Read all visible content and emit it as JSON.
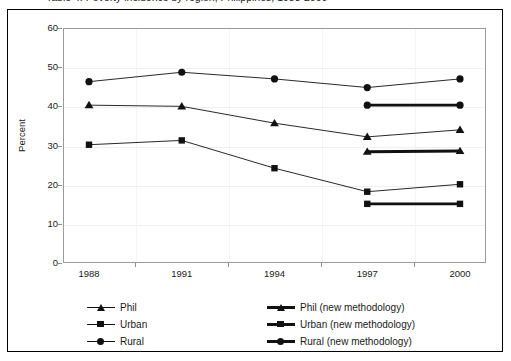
{
  "figure": {
    "title_clipped": "Table 4. Poverty incidence by region, Philippines, 1988-2000",
    "frame_color": "#000000",
    "plot_border_color": "#9a9a9a"
  },
  "chart_data": {
    "type": "line",
    "title": "",
    "xlabel": "",
    "ylabel": "Percent",
    "x": [
      1988,
      1991,
      1994,
      1997,
      2000
    ],
    "categories": [
      "1988",
      "1991",
      "1994",
      "1997",
      "2000"
    ],
    "ylim": [
      0,
      60
    ],
    "ytick_labels": [
      "0",
      "10",
      "20",
      "30",
      "40",
      "50",
      "60"
    ],
    "ytick_values": [
      0,
      10,
      20,
      30,
      40,
      50,
      60
    ],
    "grid": true,
    "legend_position": "bottom",
    "series": [
      {
        "name": "Phil",
        "marker": "triangle",
        "line": "thin",
        "color": "#111111",
        "x": [
          1988,
          1991,
          1994,
          1997,
          2000
        ],
        "values": [
          40.3,
          40.0,
          35.7,
          32.2,
          34.0
        ]
      },
      {
        "name": "Urban",
        "marker": "square",
        "line": "thin",
        "color": "#111111",
        "x": [
          1988,
          1991,
          1994,
          1997,
          2000
        ],
        "values": [
          30.2,
          31.3,
          24.2,
          18.2,
          20.1
        ]
      },
      {
        "name": "Rural",
        "marker": "circle",
        "line": "thin",
        "color": "#111111",
        "x": [
          1988,
          1991,
          1994,
          1997,
          2000
        ],
        "values": [
          46.3,
          48.7,
          47.0,
          44.8,
          47.0
        ]
      },
      {
        "name": "Phil (new methodology)",
        "marker": "triangle",
        "line": "thick",
        "color": "#111111",
        "x": [
          1997,
          2000
        ],
        "values": [
          28.4,
          28.6
        ]
      },
      {
        "name": "Urban (new methodology)",
        "marker": "square",
        "line": "thick",
        "color": "#111111",
        "x": [
          1997,
          2000
        ],
        "values": [
          15.1,
          15.1
        ]
      },
      {
        "name": "Rural (new methodology)",
        "marker": "circle",
        "line": "thick",
        "color": "#111111",
        "x": [
          1997,
          2000
        ],
        "values": [
          40.3,
          40.3
        ]
      }
    ]
  },
  "legend": {
    "left_column": [
      {
        "label": "Phil",
        "marker": "triangle",
        "line": "thin"
      },
      {
        "label": "Urban",
        "marker": "square",
        "line": "thin"
      },
      {
        "label": "Rural",
        "marker": "circle",
        "line": "thin"
      }
    ],
    "right_column": [
      {
        "label": "Phil (new methodology)",
        "marker": "triangle",
        "line": "thick"
      },
      {
        "label": "Urban (new methodology)",
        "marker": "square",
        "line": "thick"
      },
      {
        "label": "Rural (new methodology)",
        "marker": "circle",
        "line": "thick"
      }
    ]
  }
}
